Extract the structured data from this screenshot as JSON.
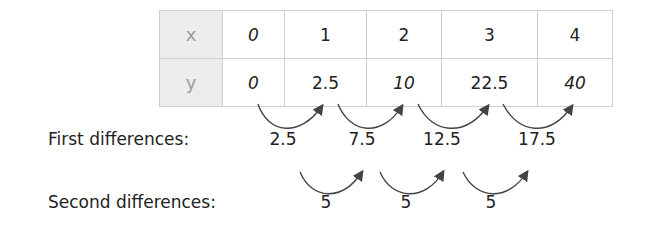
{
  "table": {
    "rows": [
      {
        "label": "x",
        "values": [
          "0",
          "1",
          "2",
          "3",
          "4"
        ]
      },
      {
        "label": "y",
        "values": [
          "0",
          "2.5",
          "10",
          "22.5",
          "40"
        ]
      }
    ]
  },
  "first_differences": {
    "label": "First differences:",
    "values": [
      "2.5",
      "7.5",
      "12.5",
      "17.5"
    ]
  },
  "second_differences": {
    "label": "Second differences:",
    "values": [
      "5",
      "5",
      "5"
    ]
  },
  "colors": {
    "header_bg": "#ececec",
    "header_text": "#9a9a9a",
    "grid": "#cfcfcf",
    "arrow": "#444444"
  }
}
